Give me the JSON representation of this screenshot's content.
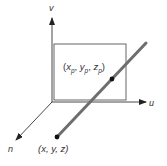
{
  "diagram": {
    "type": "3d-viewing-coordinate-projection",
    "axes": {
      "v": {
        "label": "v"
      },
      "u": {
        "label": "u"
      },
      "n": {
        "label": "n"
      }
    },
    "view_plane": {
      "label": "view plane"
    },
    "projected_point": {
      "label_open": "(",
      "x": "x",
      "x_sub": "p",
      "y": "y",
      "y_sub": "p",
      "z": "z",
      "z_sub": "p",
      "label_close": ")",
      "sep": ", "
    },
    "source_point": {
      "label": "(x, y, z)"
    },
    "colors": {
      "axis": "#333333",
      "plane": "#555555",
      "projector_line": "#6e6e6e",
      "point": "#111111",
      "text": "#333333"
    }
  }
}
